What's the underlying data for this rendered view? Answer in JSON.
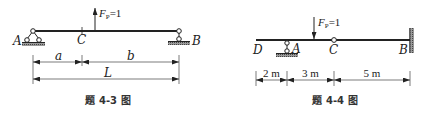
{
  "figures": [
    {
      "id": "fig-4-3",
      "caption": "题 4-3 图",
      "beam": "simply supported beam A–B",
      "force": {
        "symbol": "F",
        "subscript": "P",
        "value": "=1",
        "direction": "up"
      },
      "points": {
        "A": "A",
        "B": "B",
        "C": "C"
      },
      "dimensions": {
        "a": "a",
        "b": "b",
        "L": "L"
      }
    },
    {
      "id": "fig-4-4",
      "caption": "题 4-4 图",
      "beam": "beam D–B with hinge C, support A, fixed end B",
      "force": {
        "symbol": "F",
        "subscript": "P",
        "value": "=1",
        "direction": "down"
      },
      "points": {
        "D": "D",
        "A": "A",
        "C": "C",
        "B": "B"
      },
      "dimensions": {
        "DA": "2 m",
        "AC": "3 m",
        "CB": "5 m"
      }
    }
  ],
  "colors": {
    "ink": "#222222",
    "hatch": "#555555",
    "background": "#ffffff"
  }
}
